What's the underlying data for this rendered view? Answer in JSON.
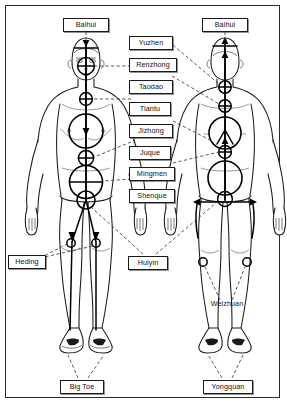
{
  "diagram": {
    "view_front_label": "front view",
    "view_back_label": "back view",
    "colors": {
      "ink": "#111111",
      "border": "#2b2b2b",
      "background": "#ffffff",
      "meridian": "#000000",
      "leader_line": "#333333"
    }
  },
  "labels": {
    "baihui_front": "Baihui",
    "baihui_back": "Baihui",
    "yuzhen": "Yuzhen",
    "renzhong": "Renzhong",
    "taodao": "Taodao",
    "tiantu": "Tiantu",
    "jizhong": "Jizhong",
    "juque": "Juque",
    "mingmen": "Mingmen",
    "shenque": "Shenque",
    "heding": "Heding",
    "huiyin": "Huiyin",
    "weizhuan": "Weizhuan",
    "big_toe": "Big Toe",
    "yongquan": "Yongquan"
  },
  "points": [
    {
      "name": "Baihui",
      "figure": "front",
      "region": "crown"
    },
    {
      "name": "Baihui",
      "figure": "back",
      "region": "crown"
    },
    {
      "name": "Renzhong",
      "figure": "front",
      "region": "face"
    },
    {
      "name": "Tiantu",
      "figure": "front",
      "region": "throat"
    },
    {
      "name": "Juque",
      "figure": "front",
      "region": "upper-abdomen"
    },
    {
      "name": "Shenque",
      "figure": "front",
      "region": "navel"
    },
    {
      "name": "Huiyin",
      "figure": "front",
      "region": "perineum"
    },
    {
      "name": "Heding",
      "figure": "front",
      "region": "knee"
    },
    {
      "name": "Big Toe",
      "figure": "front",
      "region": "foot"
    },
    {
      "name": "Yuzhen",
      "figure": "back",
      "region": "occiput"
    },
    {
      "name": "Taodao",
      "figure": "back",
      "region": "upper-spine"
    },
    {
      "name": "Jizhong",
      "figure": "back",
      "region": "mid-spine"
    },
    {
      "name": "Mingmen",
      "figure": "back",
      "region": "lower-spine"
    },
    {
      "name": "Huiyin",
      "figure": "back",
      "region": "perineum"
    },
    {
      "name": "Weizhuan",
      "figure": "back",
      "region": "popliteal"
    },
    {
      "name": "Yongquan",
      "figure": "back",
      "region": "sole"
    }
  ]
}
